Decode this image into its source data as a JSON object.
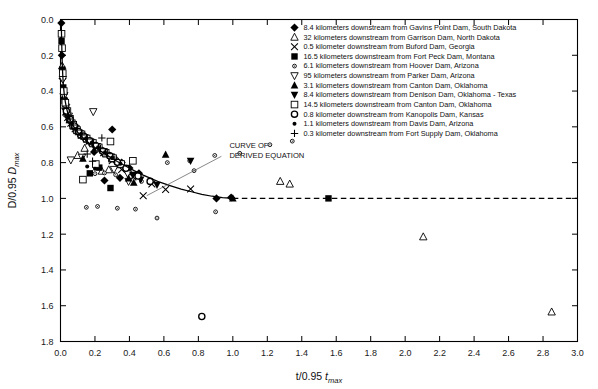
{
  "chart_data": {
    "type": "scatter",
    "title": "",
    "xlabel": "t/0.95 t_max",
    "ylabel": "D/0.95 D_max",
    "xlim": [
      0.0,
      3.0
    ],
    "ylim": [
      0.0,
      1.8
    ],
    "y_inverted": true,
    "grid": false,
    "legend_position": "top-right",
    "xticks": [
      "0.0",
      "0.2",
      "0.4",
      "0.6",
      "0.8",
      "1.0",
      "1.2",
      "1.4",
      "1.6",
      "1.8",
      "2.0",
      "2.2",
      "2.4",
      "2.6",
      "2.8",
      "3.0"
    ],
    "yticks": [
      "0.0",
      "0.2",
      "0.4",
      "0.6",
      "0.8",
      "1.0",
      "1.2",
      "1.4",
      "1.6",
      "1.8"
    ],
    "annotations": [
      {
        "text_line1": "CURVE OF",
        "text_line2": "DERIVED EQUATION",
        "x": 0.98,
        "y": 0.72
      }
    ],
    "derived_curve": {
      "label": "CURVE OF DERIVED EQUATION",
      "solid_points": [
        [
          0.004,
          0.0
        ],
        [
          0.006,
          0.09
        ],
        [
          0.008,
          0.17
        ],
        [
          0.01,
          0.24
        ],
        [
          0.013,
          0.31
        ],
        [
          0.017,
          0.37
        ],
        [
          0.022,
          0.42
        ],
        [
          0.028,
          0.46
        ],
        [
          0.036,
          0.5
        ],
        [
          0.046,
          0.535
        ],
        [
          0.058,
          0.565
        ],
        [
          0.072,
          0.592
        ],
        [
          0.09,
          0.618
        ],
        [
          0.11,
          0.642
        ],
        [
          0.135,
          0.665
        ],
        [
          0.165,
          0.69
        ],
        [
          0.2,
          0.715
        ],
        [
          0.24,
          0.74
        ],
        [
          0.285,
          0.768
        ],
        [
          0.33,
          0.794
        ],
        [
          0.38,
          0.82
        ],
        [
          0.43,
          0.846
        ],
        [
          0.48,
          0.87
        ],
        [
          0.53,
          0.891
        ],
        [
          0.58,
          0.911
        ],
        [
          0.64,
          0.93
        ],
        [
          0.7,
          0.948
        ],
        [
          0.76,
          0.963
        ],
        [
          0.82,
          0.977
        ],
        [
          0.88,
          0.988
        ],
        [
          0.94,
          0.996
        ],
        [
          1.0,
          1.0
        ]
      ],
      "dashed_points": [
        [
          1.0,
          1.0
        ],
        [
          3.0,
          1.0
        ]
      ]
    },
    "series": [
      {
        "name": "8.4 kilometers downstream from Gavins Point Dam, South Dakota",
        "marker": "filled-diamond",
        "points": [
          [
            0.005,
            0.02
          ],
          [
            0.008,
            0.2
          ],
          [
            0.012,
            0.33
          ],
          [
            0.02,
            0.44
          ],
          [
            0.03,
            0.5
          ],
          [
            0.045,
            0.545
          ],
          [
            0.062,
            0.575
          ],
          [
            0.082,
            0.605
          ],
          [
            0.105,
            0.628
          ],
          [
            0.13,
            0.65
          ],
          [
            0.16,
            0.672
          ],
          [
            0.195,
            0.698
          ],
          [
            0.23,
            0.722
          ],
          [
            0.27,
            0.748
          ],
          [
            0.31,
            0.772
          ],
          [
            0.355,
            0.8
          ],
          [
            0.4,
            0.83
          ],
          [
            0.455,
            0.86
          ],
          [
            0.3,
            0.615
          ],
          [
            0.195,
            0.74
          ],
          [
            0.345,
            0.885
          ],
          [
            0.255,
            0.9
          ],
          [
            0.99,
            0.995
          ],
          [
            0.905,
            1.0
          ]
        ]
      },
      {
        "name": "32 kilometers downstream from Garrison Dam, North Dakota",
        "marker": "open-triangle-up",
        "points": [
          [
            0.01,
            0.26
          ],
          [
            0.018,
            0.4
          ],
          [
            0.028,
            0.48
          ],
          [
            0.04,
            0.525
          ],
          [
            0.055,
            0.56
          ],
          [
            0.075,
            0.595
          ],
          [
            0.098,
            0.622
          ],
          [
            0.125,
            0.648
          ],
          [
            0.155,
            0.67
          ],
          [
            0.19,
            0.695
          ],
          [
            0.225,
            0.722
          ],
          [
            0.265,
            0.752
          ],
          [
            0.3,
            0.78
          ],
          [
            0.35,
            0.812
          ],
          [
            0.14,
            0.72
          ],
          [
            0.1,
            0.76
          ],
          [
            0.24,
            0.848
          ],
          [
            0.28,
            0.84
          ],
          [
            1.33,
            0.92
          ],
          [
            1.275,
            0.905
          ],
          [
            2.105,
            1.215
          ],
          [
            2.85,
            1.635
          ]
        ]
      },
      {
        "name": "0.5 kilometer downstream from Buford Dam, Georgia",
        "marker": "x-cross",
        "points": [
          [
            0.042,
            0.548
          ],
          [
            0.06,
            0.58
          ],
          [
            0.085,
            0.61
          ],
          [
            0.12,
            0.645
          ],
          [
            0.165,
            0.68
          ],
          [
            0.205,
            0.712
          ],
          [
            0.25,
            0.745
          ],
          [
            0.3,
            0.79
          ],
          [
            0.355,
            0.838
          ],
          [
            0.42,
            0.88
          ],
          [
            0.53,
            0.92
          ],
          [
            0.61,
            0.95
          ],
          [
            0.48,
            0.985
          ],
          [
            0.755,
            0.948
          ]
        ]
      },
      {
        "name": "16.5 kilometers downstream from Fort Peck Dam, Montana",
        "marker": "filled-square",
        "points": [
          [
            0.006,
            0.12
          ],
          [
            0.01,
            0.28
          ],
          [
            0.016,
            0.38
          ],
          [
            0.024,
            0.455
          ],
          [
            0.035,
            0.505
          ],
          [
            0.05,
            0.55
          ],
          [
            0.068,
            0.585
          ],
          [
            0.09,
            0.615
          ],
          [
            0.115,
            0.64
          ],
          [
            0.145,
            0.662
          ],
          [
            0.18,
            0.688
          ],
          [
            0.215,
            0.715
          ],
          [
            0.255,
            0.745
          ],
          [
            0.295,
            0.775
          ],
          [
            0.34,
            0.81
          ],
          [
            0.225,
            0.828
          ],
          [
            0.29,
            0.942
          ],
          [
            1.555,
            1.0
          ],
          [
            0.17,
            0.86
          ]
        ]
      },
      {
        "name": "6.1 kilometers downstream from Hoover Dam, Arizona",
        "marker": "small-open-circle",
        "points": [
          [
            0.2,
            0.862
          ],
          [
            0.255,
            0.858
          ],
          [
            0.32,
            0.868
          ],
          [
            0.4,
            0.855
          ],
          [
            0.47,
            0.905
          ],
          [
            0.62,
            0.8
          ],
          [
            0.33,
            1.055
          ],
          [
            0.435,
            1.06
          ],
          [
            0.56,
            1.11
          ],
          [
            0.75,
            0.79
          ],
          [
            0.775,
            0.845
          ],
          [
            0.895,
            0.76
          ],
          [
            0.9,
            1.075
          ],
          [
            1.04,
            0.748
          ],
          [
            1.215,
            0.7
          ],
          [
            1.345,
            0.68
          ],
          [
            0.15,
            1.05
          ],
          [
            0.215,
            1.045
          ]
        ]
      },
      {
        "name": "95 kilometers downstream from Parker Dam, Arizona",
        "marker": "open-triangle-down",
        "points": [
          [
            0.014,
            0.335
          ],
          [
            0.022,
            0.425
          ],
          [
            0.033,
            0.49
          ],
          [
            0.048,
            0.54
          ],
          [
            0.065,
            0.578
          ],
          [
            0.088,
            0.61
          ],
          [
            0.112,
            0.638
          ],
          [
            0.142,
            0.662
          ],
          [
            0.175,
            0.685
          ],
          [
            0.212,
            0.71
          ],
          [
            0.25,
            0.738
          ],
          [
            0.292,
            0.768
          ],
          [
            0.19,
            0.515
          ],
          [
            0.06,
            0.785
          ],
          [
            0.125,
            0.77
          ],
          [
            0.31,
            0.838
          ],
          [
            0.39,
            0.862
          ],
          [
            0.395,
            0.905
          ]
        ]
      },
      {
        "name": "3.1 kilometers downstream from Canton Dam, Oklahoma",
        "marker": "filled-triangle-up",
        "points": [
          [
            0.03,
            0.52
          ],
          [
            0.052,
            0.562
          ],
          [
            0.078,
            0.598
          ],
          [
            0.105,
            0.63
          ],
          [
            0.135,
            0.655
          ],
          [
            0.17,
            0.68
          ],
          [
            0.208,
            0.706
          ],
          [
            0.248,
            0.735
          ],
          [
            0.29,
            0.762
          ],
          [
            0.335,
            0.795
          ],
          [
            0.13,
            0.778
          ],
          [
            0.425,
            0.912
          ],
          [
            0.61,
            0.755
          ],
          [
            0.395,
            0.888
          ],
          [
            1.0,
            1.0
          ]
        ]
      },
      {
        "name": "8.4 kilometers downstream from Denison Dam, Oklahoma - Texas",
        "marker": "filled-triangle-down",
        "points": [
          [
            0.038,
            0.532
          ],
          [
            0.058,
            0.572
          ],
          [
            0.082,
            0.602
          ],
          [
            0.108,
            0.632
          ],
          [
            0.138,
            0.658
          ],
          [
            0.172,
            0.682
          ],
          [
            0.21,
            0.708
          ],
          [
            0.252,
            0.74
          ],
          [
            0.295,
            0.77
          ],
          [
            0.345,
            0.805
          ],
          [
            0.56,
            0.925
          ],
          [
            0.755,
            0.79
          ],
          [
            0.42,
            0.868
          ],
          [
            0.465,
            0.895
          ]
        ]
      },
      {
        "name": "14.5 kilometers downstream from Canton Dam, Oklahoma",
        "marker": "open-square",
        "points": [
          [
            0.006,
            0.08
          ],
          [
            0.009,
            0.16
          ],
          [
            0.013,
            0.3
          ],
          [
            0.019,
            0.4
          ],
          [
            0.028,
            0.465
          ],
          [
            0.04,
            0.512
          ],
          [
            0.055,
            0.555
          ],
          [
            0.074,
            0.588
          ],
          [
            0.096,
            0.618
          ],
          [
            0.122,
            0.642
          ],
          [
            0.152,
            0.665
          ],
          [
            0.188,
            0.69
          ],
          [
            0.222,
            0.715
          ],
          [
            0.262,
            0.745
          ],
          [
            0.305,
            0.775
          ],
          [
            0.352,
            0.808
          ],
          [
            0.205,
            0.808
          ],
          [
            0.13,
            0.895
          ],
          [
            0.29,
            0.682
          ],
          [
            0.42,
            0.79
          ]
        ]
      },
      {
        "name": "0.8 kilometer downstream from Kanopolis Dam, Kansas",
        "marker": "open-circle",
        "points": [
          [
            0.034,
            0.512
          ],
          [
            0.056,
            0.558
          ],
          [
            0.08,
            0.595
          ],
          [
            0.104,
            0.626
          ],
          [
            0.134,
            0.652
          ],
          [
            0.168,
            0.678
          ],
          [
            0.204,
            0.704
          ],
          [
            0.244,
            0.735
          ],
          [
            0.286,
            0.762
          ],
          [
            0.33,
            0.798
          ],
          [
            0.38,
            0.832
          ],
          [
            0.45,
            0.875
          ],
          [
            0.52,
            0.905
          ],
          [
            0.82,
            1.66
          ]
        ]
      },
      {
        "name": "1.1 kilometers downstream from Davis Dam, Arizona",
        "marker": "small-filled-circle",
        "points": [
          [
            0.046,
            0.548
          ],
          [
            0.066,
            0.582
          ],
          [
            0.09,
            0.612
          ],
          [
            0.118,
            0.64
          ],
          [
            0.148,
            0.664
          ],
          [
            0.182,
            0.688
          ],
          [
            0.218,
            0.714
          ],
          [
            0.258,
            0.742
          ],
          [
            0.3,
            0.772
          ],
          [
            0.348,
            0.806
          ],
          [
            0.155,
            0.822
          ],
          [
            0.2,
            0.835
          ]
        ]
      },
      {
        "name": "0.3 kilometer downstream from Fort Supply Dam, Oklahoma",
        "marker": "plus-cross",
        "points": [
          [
            0.05,
            0.556
          ],
          [
            0.072,
            0.59
          ],
          [
            0.096,
            0.618
          ],
          [
            0.124,
            0.645
          ],
          [
            0.156,
            0.668
          ],
          [
            0.192,
            0.692
          ],
          [
            0.232,
            0.722
          ],
          [
            0.272,
            0.75
          ],
          [
            0.315,
            0.782
          ],
          [
            0.24,
            0.662
          ],
          [
            0.186,
            0.792
          ],
          [
            0.155,
            0.752
          ]
        ]
      }
    ]
  },
  "axes": {
    "x_title_main": "t/0.95 ",
    "x_title_italic": "t",
    "x_title_sub": "max",
    "y_title_main": "D/0.95 ",
    "y_title_italic": "D",
    "y_title_sub": "max"
  },
  "annotation": {
    "line1": "CURVE OF",
    "line2": "DERIVED EQUATION"
  }
}
